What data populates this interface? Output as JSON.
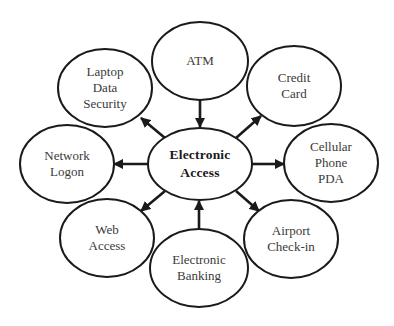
{
  "diagram": {
    "type": "hub-and-spoke",
    "center": {
      "id": "electronic-access",
      "lines": [
        "Electronic",
        "Access"
      ],
      "cx": 200,
      "cy": 164,
      "rx": 52,
      "ry": 36
    },
    "nodes": [
      {
        "id": "atm",
        "lines": [
          "ATM"
        ],
        "cx": 200,
        "cy": 61,
        "rx": 48,
        "ry": 39
      },
      {
        "id": "credit-card",
        "lines": [
          "Credit",
          "Card"
        ],
        "cx": 294,
        "cy": 86,
        "rx": 47,
        "ry": 40
      },
      {
        "id": "cellular-phone-pda",
        "lines": [
          "Cellular",
          "Phone",
          "PDA"
        ],
        "cx": 331,
        "cy": 163,
        "rx": 47,
        "ry": 39
      },
      {
        "id": "airport-check-in",
        "lines": [
          "Airport",
          "Check-in"
        ],
        "cx": 291,
        "cy": 239,
        "rx": 47,
        "ry": 39
      },
      {
        "id": "electronic-banking",
        "lines": [
          "Electronic",
          "Banking"
        ],
        "cx": 199,
        "cy": 268,
        "rx": 49,
        "ry": 39
      },
      {
        "id": "web-access",
        "lines": [
          "Web",
          "Access"
        ],
        "cx": 107,
        "cy": 238,
        "rx": 47,
        "ry": 39
      },
      {
        "id": "network-logon",
        "lines": [
          "Network",
          "Logon"
        ],
        "cx": 67,
        "cy": 164,
        "rx": 47,
        "ry": 39
      },
      {
        "id": "laptop-data-security",
        "lines": [
          "Laptop",
          "Data",
          "Security"
        ],
        "cx": 105,
        "cy": 88,
        "rx": 47,
        "ry": 39
      }
    ],
    "edges": [
      {
        "from": "atm",
        "to": "electronic-access",
        "x1": 200,
        "y1": 100,
        "x2": 200,
        "y2": 127
      },
      {
        "from": "electronic-access",
        "to": "credit-card",
        "x1": 236,
        "y1": 138,
        "x2": 261,
        "y2": 116
      },
      {
        "from": "electronic-access",
        "to": "cellular-phone-pda",
        "x1": 252,
        "y1": 164,
        "x2": 284,
        "y2": 164
      },
      {
        "from": "electronic-access",
        "to": "airport-check-in",
        "x1": 236,
        "y1": 191,
        "x2": 259,
        "y2": 211
      },
      {
        "from": "electronic-banking",
        "to": "electronic-access",
        "x1": 199,
        "y1": 229,
        "x2": 199,
        "y2": 201
      },
      {
        "from": "electronic-access",
        "to": "web-access",
        "x1": 165,
        "y1": 191,
        "x2": 141,
        "y2": 211
      },
      {
        "from": "electronic-access",
        "to": "network-logon",
        "x1": 148,
        "y1": 164,
        "x2": 114,
        "y2": 164
      },
      {
        "from": "electronic-access",
        "to": "laptop-data-security",
        "x1": 165,
        "y1": 138,
        "x2": 141,
        "y2": 118
      }
    ]
  }
}
